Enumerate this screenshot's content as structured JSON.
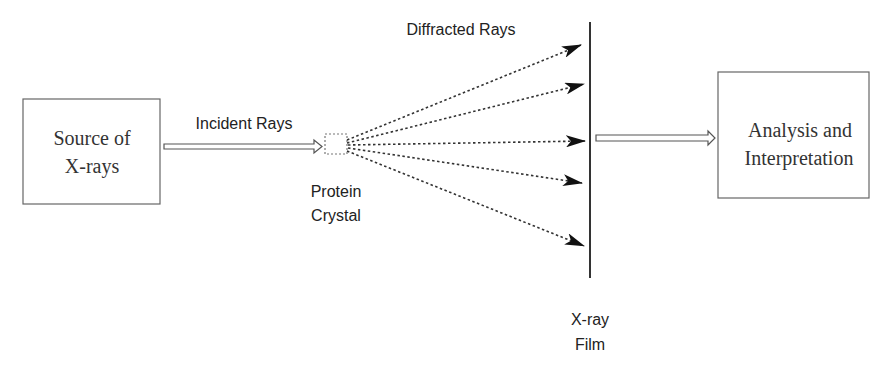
{
  "diagram": {
    "nodes": {
      "source": {
        "label_line1": "Source of",
        "label_line2": "X-rays"
      },
      "crystal": {
        "label_line1": "Protein",
        "label_line2": "Crystal"
      },
      "film": {
        "label_line1": "X-ray",
        "label_line2": "Film"
      },
      "analysis": {
        "label_line1": "Analysis and",
        "label_line2": "Interpretation"
      }
    },
    "edges": {
      "incident": {
        "label": "Incident Rays"
      },
      "diffracted": {
        "label": "Diffracted Rays",
        "count": 5
      }
    },
    "colors": {
      "stroke": "#555555",
      "text": "#222222",
      "background": "#ffffff"
    }
  }
}
